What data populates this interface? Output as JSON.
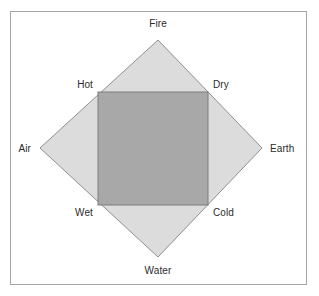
{
  "figure": {
    "kind": "four-elements-qualities-diagram",
    "frame": {
      "border_color": "#a6a6a6",
      "background_color": "#ffffff"
    }
  },
  "diamond": {
    "name": "elements-diamond",
    "fill_color": "#dcdcdc",
    "stroke_color": "#8f8f8f",
    "points": "158,40 262,148 158,257 40,148",
    "vertices": [
      {
        "id": "fire",
        "label": "Fire",
        "x": 158,
        "y": 40,
        "position": "top"
      },
      {
        "id": "earth",
        "label": "Earth",
        "x": 262,
        "y": 148,
        "position": "right"
      },
      {
        "id": "water",
        "label": "Water",
        "x": 158,
        "y": 257,
        "position": "bottom"
      },
      {
        "id": "air",
        "label": "Air",
        "x": 40,
        "y": 148,
        "position": "left"
      }
    ]
  },
  "square": {
    "name": "qualities-square",
    "fill_color": "#a8a8a8",
    "stroke_color": "#7d7d7d",
    "x": 98,
    "y": 92,
    "width": 110,
    "height": 113,
    "corners": [
      {
        "id": "hot",
        "label": "Hot",
        "x": 98,
        "y": 92,
        "position": "top-left"
      },
      {
        "id": "dry",
        "label": "Dry",
        "x": 208,
        "y": 92,
        "position": "top-right"
      },
      {
        "id": "cold",
        "label": "Cold",
        "x": 208,
        "y": 205,
        "position": "bottom-right"
      },
      {
        "id": "wet",
        "label": "Wet",
        "x": 98,
        "y": 205,
        "position": "bottom-left"
      }
    ]
  },
  "labels": {
    "fire": "Fire",
    "air": "Air",
    "earth": "Earth",
    "water": "Water",
    "hot": "Hot",
    "dry": "Dry",
    "wet": "Wet",
    "cold": "Cold"
  }
}
